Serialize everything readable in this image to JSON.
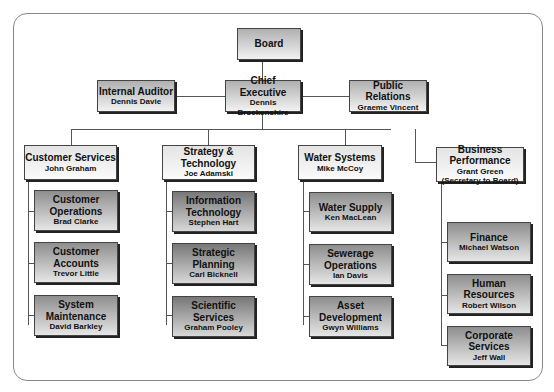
{
  "board": {
    "title": "Board"
  },
  "top": [
    {
      "title": "Internal Auditor",
      "name": "Dennis Davie"
    },
    {
      "title": "Chief Executive",
      "name": "Dennis Brockenshire"
    },
    {
      "title": "Public Relations",
      "name": "Graeme Vincent"
    }
  ],
  "divisions": [
    {
      "title": "Customer Services",
      "name": "John Graham",
      "units": [
        {
          "title": "Customer Operations",
          "name": "Brad Clarke"
        },
        {
          "title": "Customer Accounts",
          "name": "Trevor Little"
        },
        {
          "title": "System Maintenance",
          "name": "David Barkley"
        }
      ]
    },
    {
      "title": "Strategy & Technology",
      "name": "Joe Adamski",
      "units": [
        {
          "title": "Information Technology",
          "name": "Stephen Hart"
        },
        {
          "title": "Strategic Planning",
          "name": "Carl Bicknell"
        },
        {
          "title": "Scientific Services",
          "name": "Graham Pooley"
        }
      ]
    },
    {
      "title": "Water Systems",
      "name": "Mike McCoy",
      "units": [
        {
          "title": "Water Supply",
          "name": "Ken MacLean"
        },
        {
          "title": "Sewerage Operations",
          "name": "Ian Davis"
        },
        {
          "title": "Asset Development",
          "name": "Gwyn Williams"
        }
      ]
    },
    {
      "title": "Business Performance",
      "name": "Grant Green",
      "note": "(Secretary to Board)",
      "units": [
        {
          "title": "Finance",
          "name": "Michael Watson"
        },
        {
          "title": "Human Resources",
          "name": "Robert Wilson"
        },
        {
          "title": "Corporate Services",
          "name": "Jeff Wall"
        }
      ]
    }
  ]
}
